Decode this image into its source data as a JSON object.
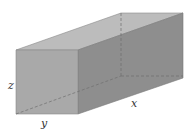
{
  "diagram": {
    "type": "rectangular-prism",
    "labels": {
      "x": "x",
      "y": "y",
      "z": "z"
    },
    "colors": {
      "front_face": "#a9a9a9",
      "top_face": "#bcbcbc",
      "right_face": "#8e8e8e",
      "edge": "#7a7a7a",
      "hidden_edge": "#6f6f6f"
    }
  }
}
